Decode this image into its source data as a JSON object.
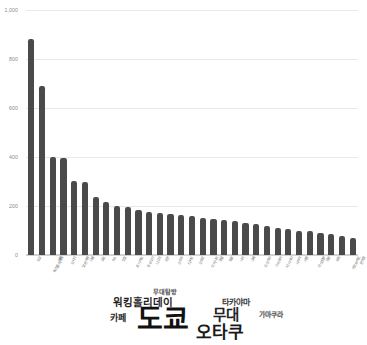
{
  "chart_data": {
    "type": "bar",
    "title": "",
    "xlabel": "",
    "ylabel": "",
    "ylim": [
      0,
      1000
    ],
    "grid": true,
    "legend": "none",
    "ytick_labels": [
      "0",
      "200",
      "400",
      "600",
      "800",
      "1,000"
    ],
    "ytick_values": [
      0,
      200,
      400,
      600,
      800,
      1000
    ],
    "categories": [
      "도쿄",
      "워킹홀리데이",
      "여행",
      "오사카",
      "일본여행",
      "카페",
      "교토",
      "숙소",
      "맛집",
      "홋카이도",
      "후쿠오카",
      "나고야",
      "온천",
      "신주쿠",
      "디저트",
      "삿포로",
      "오키나와",
      "호텔",
      "벚꽃",
      "나라",
      "고베",
      "요코하마",
      "가마쿠라",
      "타카야마",
      "시부야",
      "라멘",
      "무대탐방",
      "관광",
      "유학",
      "아르바이트",
      "편의점"
    ],
    "values": [
      880,
      690,
      400,
      398,
      302,
      298,
      238,
      215,
      200,
      196,
      182,
      175,
      170,
      166,
      162,
      158,
      152,
      148,
      142,
      138,
      130,
      126,
      120,
      112,
      106,
      100,
      96,
      90,
      84,
      78,
      70
    ]
  },
  "word_cloud": {
    "words": [
      {
        "text": "무대탐방",
        "size": 6.2,
        "x": 153,
        "y": 1,
        "color": "#4a4a4a",
        "weight": "bold"
      },
      {
        "text": "워킹홀리데이",
        "size": 10.5,
        "x": 113,
        "y": 9,
        "color": "#1f1f1f",
        "weight": "bold"
      },
      {
        "text": "타카야마",
        "size": 8.0,
        "x": 222,
        "y": 11,
        "color": "#3a3a3a",
        "weight": "bold"
      },
      {
        "text": "카페",
        "size": 9.0,
        "x": 110,
        "y": 26,
        "color": "#2a2a2a",
        "weight": "bold"
      },
      {
        "text": "도쿄",
        "size": 28.0,
        "x": 137,
        "y": 18,
        "color": "#111111",
        "weight": "bold"
      },
      {
        "text": "무대",
        "size": 14.5,
        "x": 213,
        "y": 20,
        "color": "#222222",
        "weight": "bold"
      },
      {
        "text": "가마쿠라",
        "size": 6.8,
        "x": 259,
        "y": 24,
        "color": "#4a4a4a",
        "weight": "bold"
      },
      {
        "text": "오타쿠",
        "size": 17.0,
        "x": 196,
        "y": 36,
        "color": "#1a1a1a",
        "weight": "bold"
      }
    ]
  }
}
